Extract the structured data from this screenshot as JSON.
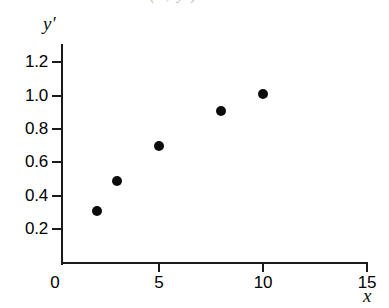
{
  "figure": {
    "background_color": "#ffffff",
    "axis_color": "#1a1a1a",
    "marker_color": "#0b0b0b",
    "caption_bleed_text": "(x, y')"
  },
  "chart_data": {
    "type": "scatter",
    "title": "",
    "xlabel": "x",
    "ylabel": "y'",
    "xlim": [
      0,
      15
    ],
    "ylim": [
      0,
      1.3
    ],
    "grid": false,
    "legend": null,
    "x_ticks": [
      0,
      5,
      10,
      15
    ],
    "x_tick_labels": [
      "0",
      "5",
      "10",
      "15"
    ],
    "y_ticks": [
      0.2,
      0.4,
      0.6,
      0.8,
      1.0,
      1.2
    ],
    "y_tick_labels": [
      "0.2",
      "0.4",
      "0.6",
      "0.8",
      "1.0",
      "1.2"
    ],
    "series": [
      {
        "name": "data",
        "marker": "filled-circle",
        "color": "#0b0b0b",
        "x": [
          2,
          3,
          5,
          8,
          10
        ],
        "y": [
          0.31,
          0.49,
          0.7,
          0.91,
          1.01
        ],
        "points": [
          {
            "x": 2,
            "y": 0.31
          },
          {
            "x": 3,
            "y": 0.49
          },
          {
            "x": 5,
            "y": 0.7
          },
          {
            "x": 8,
            "y": 0.91
          },
          {
            "x": 10,
            "y": 1.01
          }
        ]
      }
    ]
  }
}
